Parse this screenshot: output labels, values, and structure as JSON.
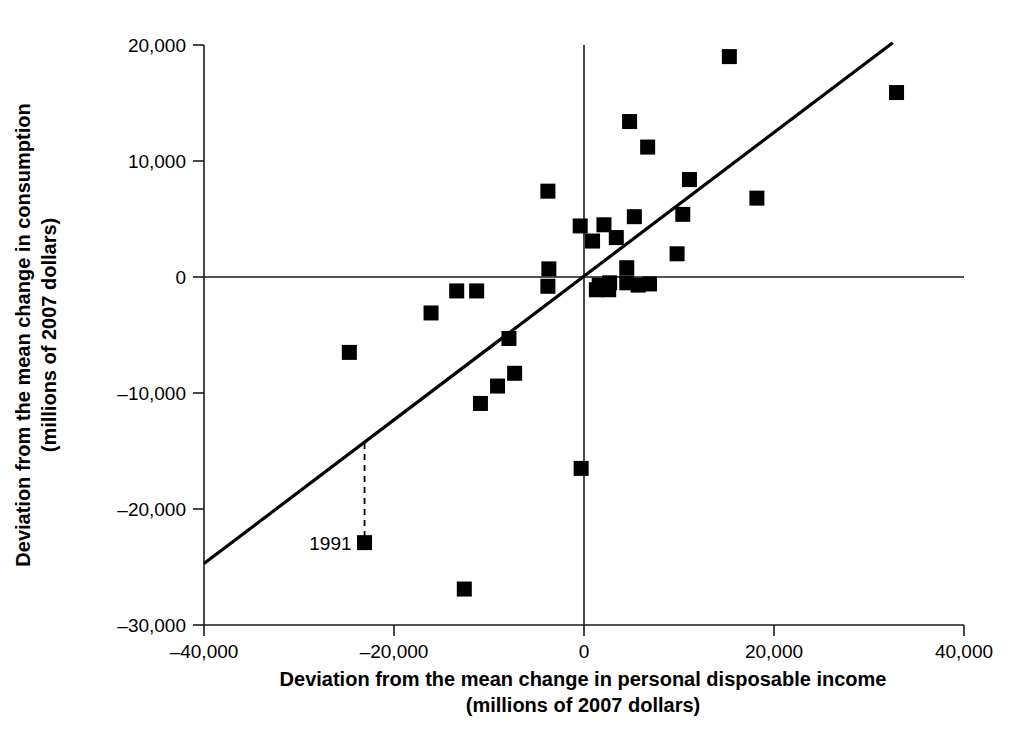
{
  "chart_data": {
    "type": "scatter",
    "title": "",
    "xlabel": "Deviation from the mean change in personal disposable income",
    "xlabel_line2": "(millions of 2007 dollars)",
    "ylabel": "Deviation from the mean change in consumption",
    "ylabel_line2": "(millions of 2007 dollars)",
    "xlim": [
      -40000,
      40000
    ],
    "ylim": [
      -30000,
      20000
    ],
    "xticks": [
      -40000,
      -20000,
      0,
      20000,
      40000
    ],
    "xtick_labels": [
      "–40,000",
      "–20,000",
      "0",
      "20,000",
      "40,000"
    ],
    "yticks": [
      20000,
      10000,
      0,
      -10000,
      -20000,
      -30000
    ],
    "ytick_labels": [
      "20,000",
      "10,000",
      "0",
      "–10,000",
      "–20,000",
      "–30,000"
    ],
    "grid": false,
    "legend": "none",
    "marker": "square",
    "marker_color": "#000000",
    "points": [
      {
        "x": -24700,
        "y": -6500
      },
      {
        "x": -23100,
        "y": -22900
      },
      {
        "x": -16100,
        "y": -3100
      },
      {
        "x": -13400,
        "y": -1200
      },
      {
        "x": -12600,
        "y": -26900
      },
      {
        "x": -11300,
        "y": -1200
      },
      {
        "x": -10900,
        "y": -10900
      },
      {
        "x": -9100,
        "y": -9400
      },
      {
        "x": -7900,
        "y": -5300
      },
      {
        "x": -7300,
        "y": -8300
      },
      {
        "x": -3800,
        "y": 7400
      },
      {
        "x": -3800,
        "y": -800
      },
      {
        "x": -3700,
        "y": 700
      },
      {
        "x": -400,
        "y": 4400
      },
      {
        "x": -300,
        "y": -16500
      },
      {
        "x": 900,
        "y": 3100
      },
      {
        "x": 1300,
        "y": -1100
      },
      {
        "x": 1600,
        "y": -700
      },
      {
        "x": 2100,
        "y": 4500
      },
      {
        "x": 2600,
        "y": -1100
      },
      {
        "x": 2700,
        "y": -500
      },
      {
        "x": 3400,
        "y": 3400
      },
      {
        "x": 4500,
        "y": 800
      },
      {
        "x": 4500,
        "y": -500
      },
      {
        "x": 4800,
        "y": 13400
      },
      {
        "x": 5300,
        "y": 5200
      },
      {
        "x": 5700,
        "y": -700
      },
      {
        "x": 6700,
        "y": 11200
      },
      {
        "x": 6900,
        "y": -600
      },
      {
        "x": 9800,
        "y": 2000
      },
      {
        "x": 10400,
        "y": 5400
      },
      {
        "x": 11100,
        "y": 8400
      },
      {
        "x": 15300,
        "y": 19000
      },
      {
        "x": 18200,
        "y": 6800
      },
      {
        "x": 32900,
        "y": 15900
      }
    ],
    "regression_line": {
      "x1": -40000,
      "y1": -24700,
      "x2": 32500,
      "y2": 20200
    },
    "annotations": [
      {
        "label": "1991",
        "point_x": -23100,
        "point_y": -22900,
        "residual_line_top_y": -14300,
        "style": "dashed-residual"
      }
    ]
  }
}
